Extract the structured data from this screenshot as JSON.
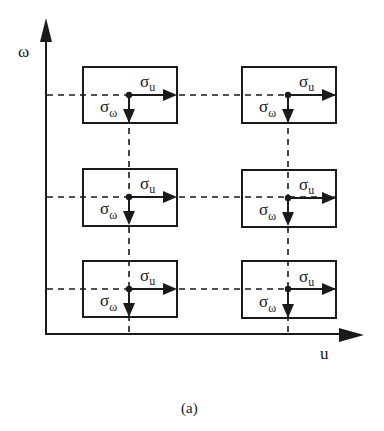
{
  "figure": {
    "caption": "(a)",
    "axes": {
      "y_label": "ω",
      "x_label": "u"
    },
    "cell_labels": {
      "sigma": "σ",
      "u_sub": "u",
      "omega_sub": "ω"
    },
    "grid": {
      "columns": 2,
      "rows": 3,
      "cells": [
        {
          "row": 1,
          "col": 1,
          "horizontal_label": "σu",
          "vertical_label": "σω"
        },
        {
          "row": 1,
          "col": 2,
          "horizontal_label": "σu",
          "vertical_label": "σω"
        },
        {
          "row": 2,
          "col": 1,
          "horizontal_label": "σu",
          "vertical_label": "σω"
        },
        {
          "row": 2,
          "col": 2,
          "horizontal_label": "σu",
          "vertical_label": "σω"
        },
        {
          "row": 3,
          "col": 1,
          "horizontal_label": "σu",
          "vertical_label": "σω"
        },
        {
          "row": 3,
          "col": 2,
          "horizontal_label": "σu",
          "vertical_label": "σω"
        }
      ]
    },
    "colors": {
      "ink": "#1a1a1a",
      "background": "#ffffff"
    }
  }
}
